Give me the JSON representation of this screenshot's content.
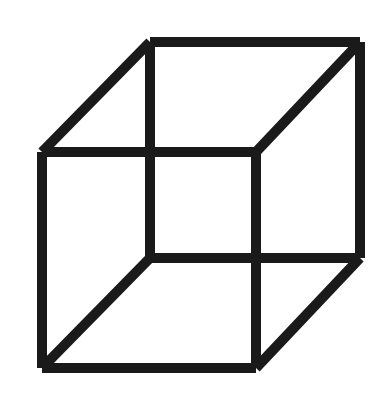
{
  "figure": {
    "name": "Necker cube",
    "type": "line-drawing",
    "canvas": {
      "width": 391,
      "height": 415,
      "background_color": "#ffffff"
    },
    "style": {
      "stroke_color": "#1a1a1a",
      "stroke_width": 10,
      "line_cap": "butt",
      "fill": "none"
    },
    "vertices": {
      "front_top_left": {
        "x": 42,
        "y": 152
      },
      "front_top_right": {
        "x": 256,
        "y": 152
      },
      "front_bottom_right": {
        "x": 256,
        "y": 368
      },
      "front_bottom_left": {
        "x": 42,
        "y": 368
      },
      "back_top_left": {
        "x": 150,
        "y": 42
      },
      "back_top_right": {
        "x": 360,
        "y": 42
      },
      "back_bottom_right": {
        "x": 360,
        "y": 258
      },
      "back_bottom_left": {
        "x": 150,
        "y": 258
      }
    },
    "edges": [
      {
        "name": "front-face-top-edge",
        "x1": 42,
        "y1": 152,
        "x2": 256,
        "y2": 152
      },
      {
        "name": "front-face-right-edge",
        "x1": 256,
        "y1": 152,
        "x2": 256,
        "y2": 368
      },
      {
        "name": "front-face-bottom-edge",
        "x1": 256,
        "y1": 368,
        "x2": 42,
        "y2": 368
      },
      {
        "name": "front-face-left-edge",
        "x1": 42,
        "y1": 368,
        "x2": 42,
        "y2": 152
      },
      {
        "name": "back-face-top-edge",
        "x1": 150,
        "y1": 42,
        "x2": 360,
        "y2": 42
      },
      {
        "name": "back-face-right-edge",
        "x1": 360,
        "y1": 42,
        "x2": 360,
        "y2": 258
      },
      {
        "name": "back-face-bottom-edge",
        "x1": 360,
        "y1": 258,
        "x2": 150,
        "y2": 258
      },
      {
        "name": "back-face-left-edge",
        "x1": 150,
        "y1": 258,
        "x2": 150,
        "y2": 42
      },
      {
        "name": "connector-top-left",
        "x1": 42,
        "y1": 152,
        "x2": 150,
        "y2": 42
      },
      {
        "name": "connector-top-right",
        "x1": 256,
        "y1": 152,
        "x2": 360,
        "y2": 42
      },
      {
        "name": "connector-bottom-right",
        "x1": 256,
        "y1": 368,
        "x2": 360,
        "y2": 258
      },
      {
        "name": "connector-bottom-left",
        "x1": 42,
        "y1": 368,
        "x2": 150,
        "y2": 258
      }
    ]
  }
}
